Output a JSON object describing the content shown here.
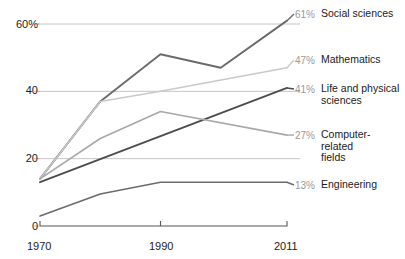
{
  "chart_data": {
    "type": "line",
    "title": "",
    "xlabel": "",
    "ylabel": "",
    "x": [
      1970,
      1980,
      1990,
      2000,
      2011
    ],
    "xticks": [
      "1970",
      "1990",
      "2011"
    ],
    "xtick_values": [
      1970,
      1990,
      2011
    ],
    "yticks": [
      "60%",
      "40",
      "20",
      "0"
    ],
    "ytick_values": [
      60,
      40,
      20,
      0
    ],
    "ylim": [
      0,
      62
    ],
    "xlim": [
      1970,
      2011
    ],
    "grid": true,
    "legend_position": "right-inline-end-labels",
    "series": [
      {
        "name": "Social sciences",
        "color": "#6b6b6b",
        "end_value_label": "61%",
        "end_value": 61,
        "x": [
          1970,
          1980,
          1990,
          2000,
          2011
        ],
        "values": [
          14,
          37,
          51,
          47,
          61
        ]
      },
      {
        "name": "Mathematics",
        "color": "#c9c9c9",
        "end_value_label": "47%",
        "end_value": 47,
        "x": [
          1970,
          1980,
          1990,
          2011
        ],
        "values": [
          14,
          37,
          40,
          47
        ]
      },
      {
        "name": "Life and physical sciences",
        "color": "#4d4d4d",
        "end_value_label": "41%",
        "end_value": 41,
        "x": [
          1970,
          2011
        ],
        "values": [
          13,
          41
        ]
      },
      {
        "name": "Computer-related fields",
        "color": "#a8a8a8",
        "end_value_label": "27%",
        "end_value": 27,
        "x": [
          1970,
          1980,
          1990,
          2011
        ],
        "values": [
          14,
          26,
          34,
          27
        ]
      },
      {
        "name": "Engineering",
        "color": "#6b6b6b",
        "end_value_label": "13%",
        "end_value": 13,
        "x": [
          1970,
          1980,
          1990,
          2011
        ],
        "values": [
          3,
          9.5,
          13,
          13
        ]
      }
    ],
    "series_label_lines": [
      [
        "Social sciences"
      ],
      [
        "Mathematics"
      ],
      [
        "Life and physical",
        "sciences"
      ],
      [
        "Computer-",
        "related",
        "fields"
      ],
      [
        "Engineering"
      ]
    ],
    "colors": {
      "axis": "#555555",
      "grid": "#b5b5b5",
      "text": "#1a1a1a",
      "value_label": "#9a9a9a",
      "background": "#ffffff"
    }
  }
}
